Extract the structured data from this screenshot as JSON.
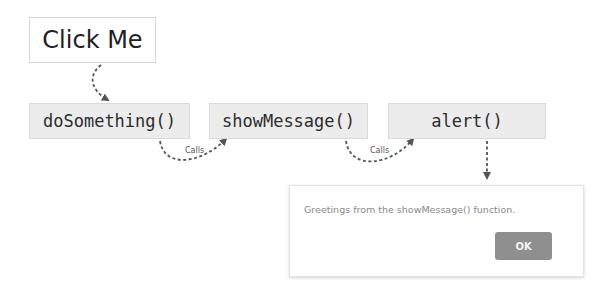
{
  "diagram": {
    "trigger": {
      "label": "Click Me"
    },
    "functions": [
      {
        "label": "doSomething()"
      },
      {
        "label": "showMessage()"
      },
      {
        "label": "alert()"
      }
    ],
    "edges": [
      {
        "from": "Click Me",
        "to": "doSomething()",
        "label": ""
      },
      {
        "from": "doSomething()",
        "to": "showMessage()",
        "label": "Calls"
      },
      {
        "from": "showMessage()",
        "to": "alert()",
        "label": "Calls"
      },
      {
        "from": "alert()",
        "to": "dialog",
        "label": ""
      }
    ],
    "dialog": {
      "message": "Greetings from the showMessage() function.",
      "ok_label": "OK"
    },
    "colors": {
      "arrow": "#555555",
      "function_box_bg": "#ececec",
      "ok_button_bg": "#8f8f8f"
    }
  }
}
